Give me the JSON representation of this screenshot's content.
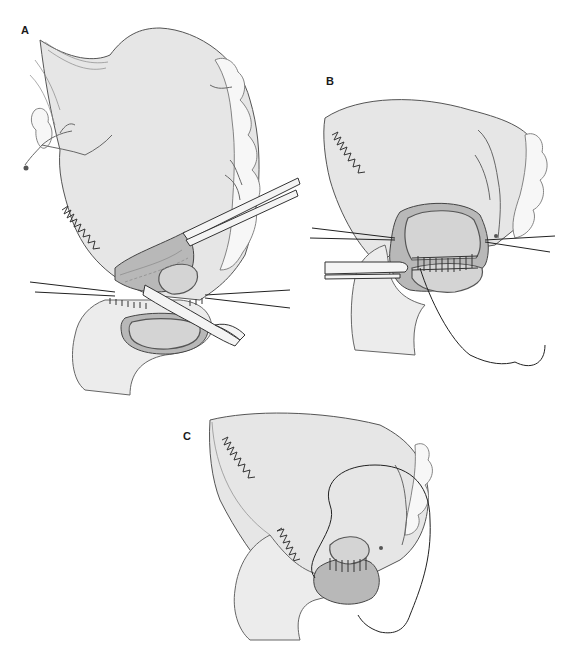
{
  "figure": {
    "type": "surgical-illustration",
    "panels": [
      {
        "id": "A",
        "label": "A",
        "description": "Stomach with stapled/sutured line; clamp retracting tissue; forceps below; anastomosis being created to bowel loop"
      },
      {
        "id": "B",
        "label": "B",
        "description": "Posterior row of sutures placed across anastomosis opening; needle and thread with forceps"
      },
      {
        "id": "C",
        "label": "C",
        "description": "Continuous suture closing anterior wall of anastomosis; needle and thread"
      }
    ]
  },
  "colors": {
    "background": "#ffffff",
    "tissue": "#e6e6e6",
    "lumen": "#b8b8b8",
    "outline": "#444444"
  }
}
